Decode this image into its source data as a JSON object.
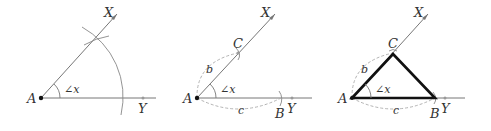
{
  "figure": {
    "colors": {
      "ray": "#777777",
      "arc": "#888888",
      "dashed": "#aaaaaa",
      "triangle": "#111111",
      "text": "#333333",
      "vertex_dot": "#111111"
    },
    "panels": [
      {
        "step": 1,
        "labels": {
          "A": "A",
          "X": "X",
          "Y": "Y",
          "angle": "∠x"
        }
      },
      {
        "step": 2,
        "labels": {
          "A": "A",
          "X": "X",
          "Y": "Y",
          "C": "C",
          "B": "B",
          "b": "b",
          "c": "c",
          "angle": "∠x"
        }
      },
      {
        "step": 3,
        "labels": {
          "A": "A",
          "X": "X",
          "Y": "Y",
          "C": "C",
          "B": "B",
          "b": "b",
          "c": "c",
          "angle": "∠x"
        }
      }
    ]
  }
}
